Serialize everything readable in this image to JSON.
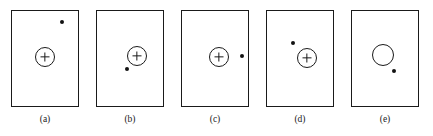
{
  "figure": {
    "width": 433,
    "height": 136,
    "background_color": "#ffffff",
    "stroke_color": "#1a1a1a",
    "dot_color": "#121212",
    "panel_count": 5
  },
  "panels": [
    {
      "id": "panel-a",
      "label": "(a)",
      "frame": {
        "x": 11,
        "y": 10,
        "width": 68,
        "height": 97
      },
      "circle": {
        "cx": 45,
        "cy": 57,
        "r": 10,
        "has_crosshair": true
      },
      "dot": {
        "cx": 62,
        "cy": 22,
        "r": 2
      },
      "dot_position": "upper-right, far from circle",
      "label_pos": {
        "cx": 45,
        "y": 114
      }
    },
    {
      "id": "panel-b",
      "label": "(b)",
      "frame": {
        "x": 96,
        "y": 10,
        "width": 68,
        "height": 97
      },
      "circle": {
        "cx": 137,
        "cy": 56,
        "r": 10,
        "has_crosshair": true
      },
      "dot": {
        "cx": 127,
        "cy": 69,
        "r": 2
      },
      "dot_position": "lower-left, adjacent to circle",
      "label_pos": {
        "cx": 130,
        "y": 114
      }
    },
    {
      "id": "panel-c",
      "label": "(c)",
      "frame": {
        "x": 181,
        "y": 10,
        "width": 68,
        "height": 97
      },
      "circle": {
        "cx": 219,
        "cy": 57,
        "r": 10,
        "has_crosshair": true
      },
      "dot": {
        "cx": 242,
        "cy": 56,
        "r": 2
      },
      "dot_position": "right, same height as circle",
      "label_pos": {
        "cx": 215,
        "y": 114
      }
    },
    {
      "id": "panel-d",
      "label": "(d)",
      "frame": {
        "x": 266,
        "y": 10,
        "width": 68,
        "height": 97
      },
      "circle": {
        "cx": 307,
        "cy": 58,
        "r": 10,
        "has_crosshair": true
      },
      "dot": {
        "cx": 293,
        "cy": 43,
        "r": 2
      },
      "dot_position": "upper-left, adjacent to circle",
      "label_pos": {
        "cx": 300,
        "y": 114
      }
    },
    {
      "id": "panel-e",
      "label": "(e)",
      "frame": {
        "x": 351,
        "y": 10,
        "width": 68,
        "height": 97
      },
      "circle": {
        "cx": 383,
        "cy": 55,
        "r": 11,
        "has_crosshair": false
      },
      "dot": {
        "cx": 394,
        "cy": 71,
        "r": 2
      },
      "dot_position": "lower-right, just below circle",
      "label_pos": {
        "cx": 385,
        "y": 114
      }
    }
  ]
}
